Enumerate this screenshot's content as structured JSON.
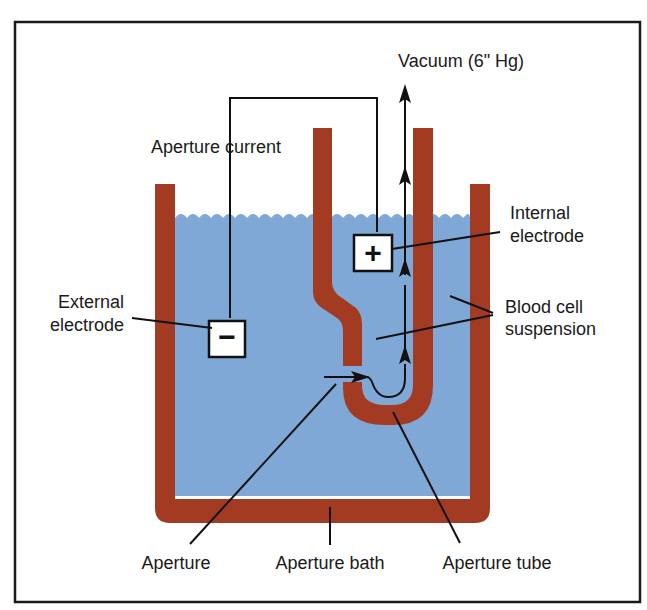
{
  "colors": {
    "frame": "#1a1a1a",
    "wall": "#a33b22",
    "liquid": "#7fa8d6",
    "background": "#ffffff",
    "electrode_box": "#ffffff"
  },
  "labels": {
    "vacuum": "Vacuum (6\" Hg)",
    "aperture_current": "Aperture current",
    "internal_electrode_l1": "Internal",
    "internal_electrode_l2": "electrode",
    "external_electrode_l1": "External",
    "external_electrode_l2": "electrode",
    "blood_cell_l1": "Blood cell",
    "blood_cell_l2": "suspension",
    "aperture": "Aperture",
    "aperture_bath": "Aperture bath",
    "aperture_tube": "Aperture tube"
  },
  "electrodes": {
    "positive_symbol": "+",
    "negative_symbol": "−"
  }
}
